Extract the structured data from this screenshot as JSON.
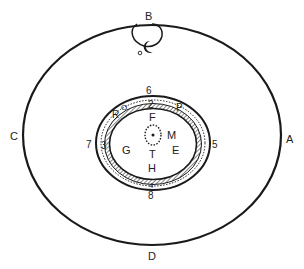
{
  "diagram": {
    "type": "concentric cross-section schematic",
    "colors": {
      "stroke": "#1a1a1a",
      "background": "#ffffff",
      "text": "#222222"
    },
    "outer_labels": {
      "top": "B",
      "right": "A",
      "bottom": "D",
      "left": "C"
    },
    "top_loop": {
      "small_circle_label": "o",
      "crescent_symbol": "☾"
    },
    "ring_labels": {
      "top_outer": "6",
      "right_outer": "5",
      "bottom_outer": "8",
      "left_outer": "7",
      "top_inner": "2",
      "left_inner": "3",
      "bottom_inner": "4",
      "upper_left_o": "O",
      "upper_left_r": "R",
      "upper_right_p": "P"
    },
    "inner_labels": {
      "top": "F",
      "right_upper": "M",
      "right": "E",
      "left": "G",
      "center_below": "T",
      "bottom": "H"
    }
  }
}
